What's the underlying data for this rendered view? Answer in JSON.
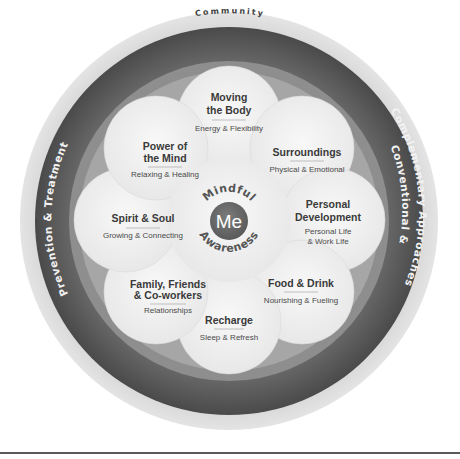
{
  "diagram": {
    "outer_ring_label": "Community",
    "left_ring_label": "Prevention & Treatment",
    "right_ring_label_line1": "Conventional &",
    "right_ring_label_line2": "Complementary Approaches",
    "center": {
      "label": "Me",
      "arc_top": "Mindful",
      "arc_bottom": "Awareness"
    },
    "petals": [
      {
        "title_line1": "Moving",
        "title_line2": "the Body",
        "subtitle_line1": "Energy & Flexibility",
        "subtitle_line2": ""
      },
      {
        "title_line1": "Surroundings",
        "title_line2": "",
        "subtitle_line1": "Physical & Emotional",
        "subtitle_line2": ""
      },
      {
        "title_line1": "Personal",
        "title_line2": "Development",
        "subtitle_line1": "Personal Life",
        "subtitle_line2": "& Work Life"
      },
      {
        "title_line1": "Food & Drink",
        "title_line2": "",
        "subtitle_line1": "Nourishing & Fueling",
        "subtitle_line2": ""
      },
      {
        "title_line1": "Recharge",
        "title_line2": "",
        "subtitle_line1": "Sleep & Refresh",
        "subtitle_line2": ""
      },
      {
        "title_line1": "Family, Friends",
        "title_line2": "& Co-workers",
        "subtitle_line1": "Relationships",
        "subtitle_line2": ""
      },
      {
        "title_line1": "Spirit & Soul",
        "title_line2": "",
        "subtitle_line1": "Growing & Connecting",
        "subtitle_line2": ""
      },
      {
        "title_line1": "Power of",
        "title_line2": "the Mind",
        "subtitle_line1": "Relaxing & Healing",
        "subtitle_line2": ""
      }
    ],
    "colors": {
      "outer_ring": "#d6d6d6",
      "dark_ring": "#555555",
      "mid_ring": "#8a8a8a",
      "inner_ring": "#a8a8a8",
      "petal": "#efefef",
      "center": "#6b6b6b"
    }
  }
}
